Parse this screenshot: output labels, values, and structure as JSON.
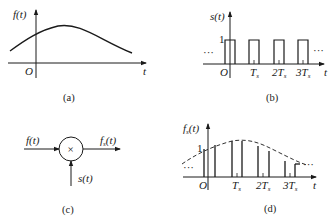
{
  "panels": {
    "a": {
      "caption": "(a)",
      "ylabel": "f(t)",
      "xlabel": "t",
      "origin": "O",
      "description": "Continuous smooth signal f(t), rising to a single peak just right of origin then decaying"
    },
    "b": {
      "caption": "(b)",
      "ylabel": "s(t)",
      "xlabel": "t",
      "origin": "O",
      "amplitude_label": "1",
      "ellipsis_left": "···",
      "ellipsis_right": "···",
      "ticks": [
        "T",
        "2T",
        "3T"
      ],
      "tick_subscript": "s",
      "description": "Periodic rectangular pulse train with period Ts and amplitude 1"
    },
    "c": {
      "caption": "(c)",
      "input_label": "f(t)",
      "output_label": "f",
      "output_subscript": "s",
      "output_suffix": "(t)",
      "control_label": "s(t)",
      "multiplier_symbol": "×",
      "description": "Multiplier block: f(t) times s(t) gives fs(t)"
    },
    "d": {
      "caption": "(d)",
      "ylabel_main": "f",
      "ylabel_sub": "s",
      "ylabel_suffix": "(t)",
      "xlabel": "t",
      "origin": "O",
      "amplitude_label": "1",
      "ellipsis_left": "···",
      "ellipsis_right": "···",
      "ticks": [
        "T",
        "2T",
        "3T"
      ],
      "tick_subscript": "s",
      "description": "Sampled signal fs(t): pulses following dashed envelope f(t)"
    }
  }
}
